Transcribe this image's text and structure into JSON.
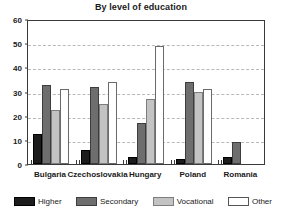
{
  "chart_data": {
    "type": "bar",
    "title": "By level of education",
    "xlabel": "",
    "ylabel": "",
    "ylim": [
      0,
      60
    ],
    "yticks": [
      0,
      10,
      20,
      30,
      40,
      50,
      60
    ],
    "ytick_labels": [
      "0",
      "10",
      "20",
      "30",
      "40",
      "50",
      "60"
    ],
    "grid": true,
    "legend_position": "bottom",
    "categories": [
      "Bulgaria",
      "Czechoslovakia",
      "Hungary",
      "Poland",
      "Romania"
    ],
    "series": [
      {
        "name": "Higher",
        "color": "#1c1c1c",
        "values": [
          12.5,
          6,
          3,
          2,
          3
        ]
      },
      {
        "name": "Secondary",
        "color": "#6e6e6e",
        "values": [
          32.5,
          32,
          17,
          34,
          9
        ]
      },
      {
        "name": "Vocational",
        "color": "#c3c3c3",
        "values": [
          22.5,
          25,
          27,
          30,
          0
        ]
      },
      {
        "name": "Other",
        "color": "#ffffff",
        "values": [
          31,
          34,
          49,
          31,
          0
        ]
      }
    ]
  }
}
